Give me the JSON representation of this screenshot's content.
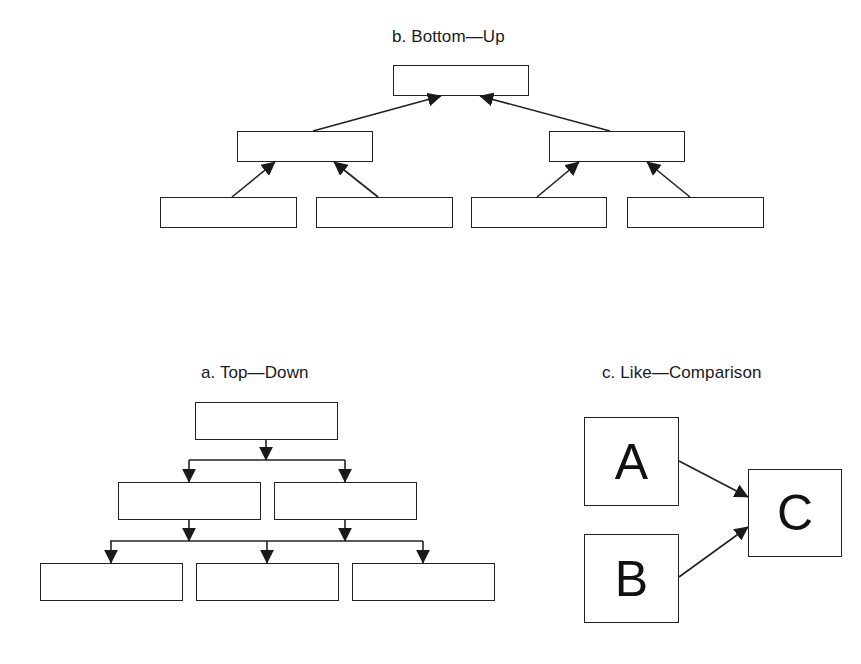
{
  "diagram": {
    "sections": {
      "bottom_up": {
        "title": "b. Bottom—Up",
        "levels": [
          1,
          2,
          4
        ],
        "arrow_direction": "up"
      },
      "top_down": {
        "title": "a. Top—Down",
        "levels": [
          1,
          2,
          3
        ],
        "arrow_direction": "down"
      },
      "like_comparison": {
        "title": "c. Like—Comparison",
        "nodes": [
          {
            "id": "A",
            "label": "A"
          },
          {
            "id": "B",
            "label": "B"
          },
          {
            "id": "C",
            "label": "C"
          }
        ],
        "edges": [
          {
            "from": "A",
            "to": "C"
          },
          {
            "from": "B",
            "to": "C"
          }
        ]
      }
    },
    "colors": {
      "stroke": "#222222",
      "background": "#ffffff",
      "text": "#1a1a1a"
    }
  }
}
